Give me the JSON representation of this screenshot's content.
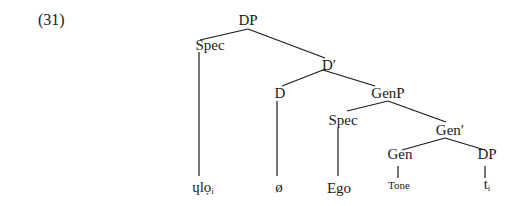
{
  "example_number": "(31)",
  "tree": {
    "root": {
      "label": "DP"
    },
    "spec_outer": {
      "label": "Spec"
    },
    "d_bar": {
      "label": "D′"
    },
    "d_head": {
      "label": "D"
    },
    "genp": {
      "label": "GenP"
    },
    "spec_inner": {
      "label": "Spec"
    },
    "gen_bar": {
      "label": "Gen′"
    },
    "gen_head": {
      "label": "Gen"
    },
    "dp_inner": {
      "label": "DP"
    },
    "leaves": {
      "spec_outer_leaf": {
        "base": "ɥlọ",
        "sub": "i"
      },
      "d_leaf": {
        "label": "ø"
      },
      "spec_inner_leaf": {
        "label": "Ego"
      },
      "gen_leaf": {
        "label": "Tone"
      },
      "dp_inner_leaf": {
        "base": "t",
        "sub": "i"
      }
    }
  },
  "colors": {
    "line": "#1a1a1a",
    "text": "#1a1a1a",
    "background": "#ffffff"
  }
}
